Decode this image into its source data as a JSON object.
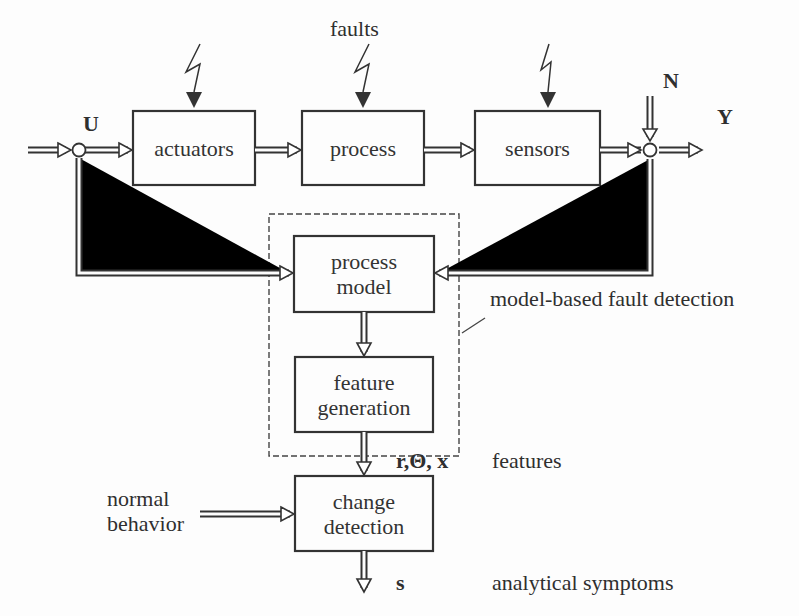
{
  "diagram": {
    "title_label": "faults",
    "signals": {
      "input": "U",
      "noise": "N",
      "output": "Y",
      "features_symbols": "r,Θ, x",
      "symptoms_symbol": "s"
    },
    "blocks": {
      "actuators": "actuators",
      "process": "process",
      "sensors": "sensors",
      "process_model_line1": "process",
      "process_model_line2": "model",
      "feature_generation_line1": "feature",
      "feature_generation_line2": "generation",
      "change_detection_line1": "change",
      "change_detection_line2": "detection"
    },
    "annotations": {
      "model_based": "model-based fault detection",
      "features": "features",
      "normal_line1": "normal",
      "normal_line2": "behavior",
      "symptoms": "analytical symptoms"
    },
    "colors": {
      "line": "#333333",
      "background": "#fdfdfd"
    }
  }
}
